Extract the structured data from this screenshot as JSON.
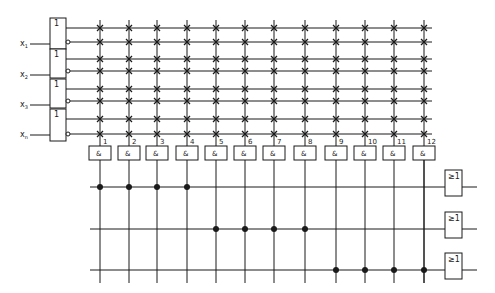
{
  "diagram": {
    "type": "PLA (programmable logic array) schematic",
    "line_color": "#1a1a1a",
    "background": "#ffffff",
    "inputs": [
      {
        "label": "x",
        "sub": "1",
        "gate_symbol": "1"
      },
      {
        "label": "x",
        "sub": "2",
        "gate_symbol": "1"
      },
      {
        "label": "x",
        "sub": "3",
        "gate_symbol": "1"
      },
      {
        "label": "x",
        "sub": "n",
        "gate_symbol": "1"
      }
    ],
    "and_terms": [
      {
        "number": "1",
        "symbol": "&"
      },
      {
        "number": "2",
        "symbol": "&"
      },
      {
        "number": "3",
        "symbol": "&"
      },
      {
        "number": "4",
        "symbol": "&"
      },
      {
        "number": "5",
        "symbol": "&"
      },
      {
        "number": "6",
        "symbol": "&"
      },
      {
        "number": "7",
        "symbol": "&"
      },
      {
        "number": "8",
        "symbol": "&"
      },
      {
        "number": "9",
        "symbol": "&"
      },
      {
        "number": "10",
        "symbol": "&"
      },
      {
        "number": "11",
        "symbol": "&"
      },
      {
        "number": "12",
        "symbol": "&"
      }
    ],
    "or_gates": [
      {
        "symbol": "≥1",
        "connected_terms": [
          1,
          2,
          3,
          4
        ]
      },
      {
        "symbol": "≥1",
        "connected_terms": [
          5,
          6,
          7,
          8
        ]
      },
      {
        "symbol": "≥1",
        "connected_terms": [
          9,
          10,
          11,
          12
        ]
      }
    ],
    "programmable_crosspoint": "x",
    "fixed_connection": "dot"
  }
}
